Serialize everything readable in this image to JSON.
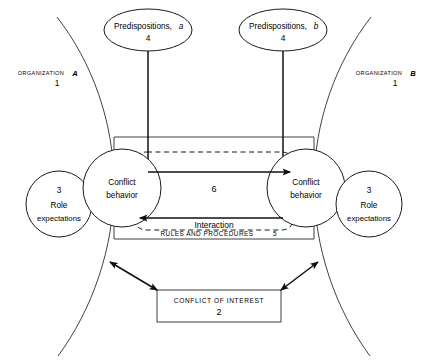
{
  "diagram": {
    "organizations": [
      {
        "id": "a",
        "name_prefix": "ORGANIZATION",
        "name_letter": "A",
        "number": "1"
      },
      {
        "id": "b",
        "name_prefix": "ORGANIZATION",
        "name_letter": "B",
        "number": "1"
      }
    ],
    "predispositions": [
      {
        "id": "a",
        "label": "Predispositions,",
        "letter": "a",
        "number": "4"
      },
      {
        "id": "b",
        "label": "Predispositions,",
        "letter": "b",
        "number": "4"
      }
    ],
    "conflict_behavior": [
      {
        "id": "a",
        "line1": "Conflict",
        "line2": "behavior"
      },
      {
        "id": "b",
        "line1": "Conflict",
        "line2": "behavior"
      }
    ],
    "role_expectations": [
      {
        "id": "a",
        "number": "3",
        "line1": "Role",
        "line2": "expectations"
      },
      {
        "id": "b",
        "number": "3",
        "line1": "Role",
        "line2": "expectations"
      }
    ],
    "center_region_number": "6",
    "interaction_label": "Interaction",
    "rules_and_procedures": {
      "label": "RULES AND PROCEDURES",
      "number": "5"
    },
    "conflict_of_interest": {
      "label": "CONFLICT OF INTEREST",
      "number": "2"
    },
    "colors": {
      "stroke": "#1a1a1a",
      "background": "#ffffff",
      "text": "#000000"
    }
  }
}
